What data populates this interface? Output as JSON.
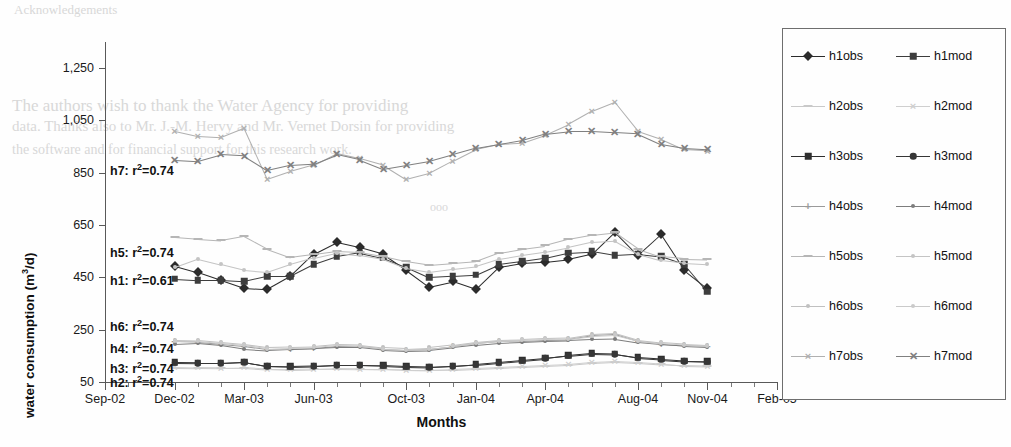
{
  "figure": {
    "background": "#fefefe",
    "bleed_lines": [
      {
        "text": "Acknowledgements",
        "x": 14,
        "y": 2,
        "size": 13
      },
      {
        "text": "The authors wish to thank the Water Agency for providing",
        "x": 12,
        "y": 96,
        "size": 17
      },
      {
        "text": "data. Thanks also to Mr. J.-M. Hervy and Mr. Vernet Dorsin for providing",
        "x": 12,
        "y": 118,
        "size": 15
      },
      {
        "text": "the software and for financial support for this research work.",
        "x": 12,
        "y": 142,
        "size": 14
      },
      {
        "text": "ooo",
        "x": 430,
        "y": 200,
        "size": 12
      }
    ]
  },
  "chart_data": {
    "type": "line",
    "title": "",
    "xlabel": "Months",
    "ylabel": "water consumption (m 3/d)",
    "ylabel_parts": {
      "prefix": "water consumption (m",
      "sup": "3",
      "suffix": "/d)"
    },
    "ylim": [
      50,
      1350
    ],
    "yticks": [
      50,
      250,
      450,
      650,
      850,
      1050,
      1250
    ],
    "ytick_labels": [
      "50",
      "250",
      "450",
      "650",
      "850",
      "1,050",
      "1,250"
    ],
    "xtick_labels": [
      "Sep-02",
      "Dec-02",
      "Mar-03",
      "Jun-03",
      "Oct-03",
      "Jan-04",
      "Apr-04",
      "Aug-04",
      "Nov-04",
      "Feb-05"
    ],
    "xlim": [
      0,
      29
    ],
    "xtick_positions": [
      0,
      3,
      6,
      9,
      13,
      16,
      19,
      23,
      26,
      29
    ],
    "grid": false,
    "legend_position": "right-outside",
    "x_index": [
      3,
      4,
      5,
      6,
      7,
      8,
      9,
      10,
      11,
      12,
      13,
      14,
      15,
      16,
      17,
      18,
      19,
      20,
      21,
      22,
      23,
      24,
      25,
      26
    ],
    "series": [
      {
        "name": "h1obs",
        "marker": "diamond",
        "color": "#2b2b2b",
        "values": [
          495,
          470,
          440,
          410,
          405,
          455,
          540,
          585,
          565,
          540,
          480,
          415,
          435,
          405,
          490,
          505,
          510,
          520,
          540,
          625,
          535,
          615,
          480,
          410
        ]
      },
      {
        "name": "h1mod",
        "marker": "square",
        "color": "#3d3d3d",
        "values": [
          445,
          440,
          440,
          435,
          455,
          455,
          500,
          530,
          545,
          525,
          490,
          450,
          455,
          460,
          500,
          512,
          525,
          545,
          550,
          535,
          540,
          530,
          500,
          395
        ]
      },
      {
        "name": "h2obs",
        "marker": "dash",
        "color": "#c9c9c9",
        "values": [
          105,
          104,
          103,
          104,
          98,
          96,
          98,
          100,
          99,
          98,
          95,
          94,
          96,
          100,
          104,
          108,
          112,
          116,
          124,
          128,
          124,
          118,
          112,
          110
        ]
      },
      {
        "name": "h2mod",
        "marker": "cross",
        "color": "#cfcfcf",
        "values": [
          108,
          106,
          105,
          106,
          100,
          98,
          100,
          102,
          101,
          100,
          97,
          96,
          98,
          102,
          106,
          110,
          114,
          118,
          126,
          130,
          126,
          120,
          114,
          112
        ]
      },
      {
        "name": "h3obs",
        "marker": "square",
        "color": "#2e2e2e",
        "values": [
          125,
          124,
          124,
          128,
          112,
          110,
          112,
          116,
          116,
          114,
          110,
          108,
          112,
          118,
          126,
          134,
          142,
          152,
          160,
          158,
          144,
          138,
          132,
          130
        ]
      },
      {
        "name": "h3mod",
        "marker": "circle",
        "color": "#363636",
        "values": [
          123,
          122,
          122,
          126,
          110,
          108,
          110,
          114,
          114,
          112,
          108,
          106,
          110,
          116,
          124,
          132,
          140,
          150,
          158,
          156,
          142,
          136,
          130,
          128
        ]
      },
      {
        "name": "h4obs",
        "marker": "plus",
        "color": "#9a9a9a",
        "values": [
          205,
          203,
          196,
          188,
          176,
          178,
          180,
          188,
          186,
          176,
          172,
          176,
          186,
          198,
          206,
          208,
          212,
          214,
          228,
          232,
          206,
          196,
          190,
          186
        ]
      },
      {
        "name": "h4mod",
        "marker": "dot",
        "color": "#7d7d7d",
        "values": [
          196,
          200,
          192,
          178,
          172,
          176,
          180,
          184,
          184,
          174,
          170,
          172,
          182,
          192,
          200,
          204,
          208,
          210,
          214,
          216,
          202,
          194,
          188,
          184
        ]
      },
      {
        "name": "h5obs",
        "marker": "dash",
        "color": "#b6b6b6",
        "values": [
          605,
          598,
          592,
          608,
          560,
          528,
          540,
          552,
          548,
          532,
          512,
          498,
          505,
          512,
          545,
          560,
          572,
          596,
          612,
          622,
          560,
          530,
          522,
          520
        ]
      },
      {
        "name": "h5mod",
        "marker": "dot",
        "color": "#c4c4c4",
        "values": [
          490,
          522,
          500,
          478,
          470,
          500,
          525,
          545,
          535,
          520,
          485,
          470,
          482,
          492,
          520,
          535,
          548,
          565,
          585,
          590,
          540,
          515,
          505,
          500
        ]
      },
      {
        "name": "h6obs",
        "marker": "dot",
        "color": "#c0c0c0",
        "values": [
          212,
          210,
          202,
          194,
          182,
          184,
          186,
          194,
          192,
          182,
          178,
          182,
          192,
          204,
          212,
          214,
          218,
          220,
          234,
          238,
          212,
          202,
          196,
          192
        ]
      },
      {
        "name": "h6mod",
        "marker": "dot",
        "color": "#cacaca",
        "values": [
          208,
          206,
          198,
          190,
          178,
          180,
          182,
          190,
          188,
          178,
          174,
          178,
          188,
          200,
          208,
          210,
          214,
          216,
          226,
          230,
          208,
          198,
          192,
          188
        ]
      },
      {
        "name": "h7obs",
        "marker": "cross",
        "color": "#b0b0b0",
        "values": [
          1010,
          990,
          985,
          1020,
          825,
          855,
          880,
          925,
          905,
          880,
          825,
          848,
          895,
          940,
          960,
          965,
          995,
          1035,
          1085,
          1120,
          1010,
          980,
          940,
          935
        ]
      },
      {
        "name": "h7mod",
        "marker": "cross-bold",
        "color": "#808080",
        "values": [
          900,
          895,
          920,
          915,
          860,
          880,
          885,
          920,
          900,
          865,
          880,
          895,
          920,
          945,
          960,
          975,
          1000,
          1010,
          1010,
          1005,
          1000,
          960,
          945,
          940
        ]
      }
    ],
    "annotations": [
      {
        "label": "h7",
        "r2": "r2=0.74",
        "text": "h7: r2=0.74",
        "x": 110,
        "y": 162
      },
      {
        "label": "h5",
        "r2": "r2=0.74",
        "text": "h5: r2=0.74",
        "x": 110,
        "y": 244
      },
      {
        "label": "h1",
        "r2": "r2=0.61",
        "text": "h1: r2=0.61",
        "x": 110,
        "y": 272
      },
      {
        "label": "h6",
        "r2": "r2=0.74",
        "text": "h6: r2=0.74",
        "x": 110,
        "y": 318
      },
      {
        "label": "h4",
        "r2": "r2=0.74",
        "text": "h4: r2=0.74",
        "x": 110,
        "y": 340
      },
      {
        "label": "h3",
        "r2": "r2=0.74",
        "text": "h3: r2=0.74",
        "x": 110,
        "y": 360
      },
      {
        "label": "h2",
        "r2": "r2=0.74",
        "text": "h2: r2=0.74",
        "x": 110,
        "y": 374
      }
    ]
  },
  "legend": {
    "rows": [
      {
        "left": "h1obs",
        "right": "h1mod"
      },
      {
        "left": "h2obs",
        "right": "h2mod"
      },
      {
        "left": "h3obs",
        "right": "h3mod"
      },
      {
        "left": "h4obs",
        "right": "h4mod"
      },
      {
        "left": "h5obs",
        "right": "h5mod"
      },
      {
        "left": "h6obs",
        "right": "h6mod"
      },
      {
        "left": "h7obs",
        "right": "h7mod"
      }
    ]
  }
}
